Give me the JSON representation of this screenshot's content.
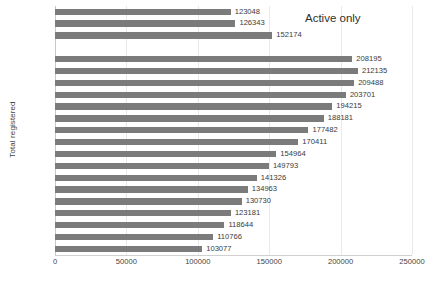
{
  "chart_data": {
    "type": "bar",
    "orientation": "horizontal",
    "title": "",
    "xlabel": "",
    "ylabel": "Total registered",
    "xlim": [
      0,
      250000
    ],
    "xticks": [
      0,
      50000,
      100000,
      150000,
      200000,
      250000
    ],
    "xticklabels": [
      "0",
      "50000",
      "100000",
      "150000",
      "200000",
      "250000"
    ],
    "grid": "vertical",
    "legend": "none",
    "annotations": [
      {
        "text": "Active only",
        "position": "top-right"
      }
    ],
    "bar_color": "#7b7b7b",
    "categories": [
      "2019*",
      "2018*",
      "2017*",
      "",
      "2016",
      "2015",
      "2014",
      "2013",
      "2012",
      "2011",
      "2010",
      "2009",
      "2008",
      "2007",
      "2006",
      "2005",
      "2004",
      "2003",
      "2002",
      "2001",
      "2000"
    ],
    "values": [
      123048,
      126343,
      152174,
      null,
      208195,
      212135,
      209488,
      203701,
      194215,
      188181,
      177482,
      170411,
      154964,
      149793,
      141326,
      134963,
      130730,
      123181,
      118644,
      110766,
      103077
    ],
    "datalabels": [
      "123048",
      "126343",
      "152174",
      "",
      "208195",
      "212135",
      "209488",
      "203701",
      "194215",
      "188181",
      "177482",
      "170411",
      "154964",
      "149793",
      "141326",
      "134963",
      "130730",
      "123181",
      "118644",
      "110766",
      "103077"
    ]
  }
}
